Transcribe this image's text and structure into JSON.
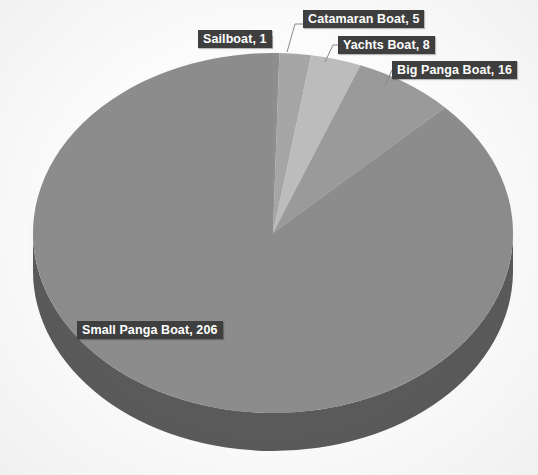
{
  "chart_data": {
    "type": "pie",
    "title": "",
    "subtitle": "",
    "xlabel": "",
    "ylabel": "",
    "legend_position": "none",
    "grid": false,
    "three_d": true,
    "total": 236,
    "categories": [
      "Small Panga Boat",
      "Big Panga Boat",
      "Yachts Boat",
      "Catamaran Boat",
      "Sailboat"
    ],
    "values": [
      206,
      16,
      8,
      5,
      1
    ],
    "slices": [
      {
        "label": "Sailboat",
        "value": 1,
        "data_label": "Sailboat, 1",
        "color": "#8e8e8e",
        "side_color": "#6d6d6d"
      },
      {
        "label": "Catamaran Boat",
        "value": 5,
        "data_label": "Catamaran Boat, 5",
        "color": "#a6a6a6",
        "side_color": "#808080"
      },
      {
        "label": "Yachts Boat",
        "value": 8,
        "data_label": "Yachts Boat, 8",
        "color": "#bcbcbc",
        "side_color": "#919191"
      },
      {
        "label": "Big Panga Boat",
        "value": 16,
        "data_label": "Big Panga Boat, 16",
        "color": "#9a9a9a",
        "side_color": "#767676"
      },
      {
        "label": "Small Panga Boat",
        "value": 206,
        "data_label": "Small Panga Boat, 206",
        "color": "#8c8c8c",
        "side_color": "#5a5a5a"
      }
    ]
  },
  "labels": {
    "sailboat": "Sailboat, 1",
    "catamaran": "Catamaran Boat, 5",
    "yachts": "Yachts Boat, 8",
    "big_panga": "Big Panga Boat, 16",
    "small_panga": "Small Panga Boat, 206"
  },
  "colors": {
    "background": "#fbfbfb",
    "callout_bg": "#3f3f3f",
    "callout_text": "#ffffff",
    "leader_line": "#8a8a8a"
  }
}
